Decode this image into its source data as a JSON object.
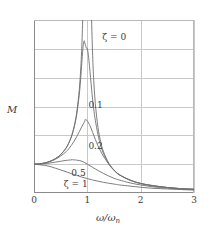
{
  "chart_data": {
    "type": "line",
    "title": "",
    "xlabel": "ω/ωn",
    "xlabel_main": "ω/ω",
    "xlabel_sub": "n",
    "ylabel": "M",
    "xlim": [
      0,
      3
    ],
    "ylim": [
      0,
      6
    ],
    "xticks": [
      "0",
      "1",
      "2",
      "3"
    ],
    "xtick_values": [
      0,
      1,
      2,
      3
    ],
    "yticks": [
      "0",
      "1",
      "2",
      "3",
      "4",
      "5",
      "6"
    ],
    "ytick_values": [
      0,
      1,
      2,
      3,
      4,
      5,
      6
    ],
    "grid": true,
    "legend": "inline-annotations",
    "line_color": "#6f6f6f",
    "grid_color": "#c9c9c9",
    "axis_color": "#8a8a8a",
    "series": [
      {
        "name": "ζ = 0",
        "zeta": 0,
        "label": "ζ = 0",
        "label_x": 1.28,
        "label_y": 5.55,
        "peak_x": 1.0,
        "peak_y": null,
        "x": [
          0,
          0.1,
          0.2,
          0.3,
          0.4,
          0.5,
          0.6,
          0.65,
          0.7,
          0.75,
          0.8,
          0.85,
          0.88,
          0.9,
          0.92,
          0.94,
          0.96,
          0.98,
          1.02,
          1.04,
          1.06,
          1.08,
          1.1,
          1.12,
          1.15,
          1.2,
          1.25,
          1.3,
          1.4,
          1.5,
          1.6,
          1.8,
          2.0,
          2.25,
          2.5,
          2.75,
          3.0
        ],
        "values": [
          1.0,
          1.01,
          1.04,
          1.1,
          1.19,
          1.33,
          1.56,
          1.73,
          1.96,
          2.29,
          2.78,
          3.6,
          4.43,
          5.26,
          6.52,
          8.6,
          12.76,
          25.25,
          24.75,
          12.26,
          8.11,
          6.03,
          4.76,
          3.91,
          3.1,
          2.27,
          1.78,
          1.45,
          1.04,
          0.8,
          0.64,
          0.45,
          0.33,
          0.25,
          0.19,
          0.15,
          0.13
        ]
      },
      {
        "name": "ζ = 0.1",
        "zeta": 0.1,
        "label": "0.1",
        "label_x": 1.02,
        "label_y": 3.18,
        "peak_x": 0.99,
        "peak_y": 5.03,
        "x": [
          0,
          0.1,
          0.2,
          0.3,
          0.4,
          0.5,
          0.6,
          0.65,
          0.7,
          0.75,
          0.8,
          0.85,
          0.88,
          0.9,
          0.92,
          0.94,
          0.96,
          0.98,
          0.99,
          1.0,
          1.02,
          1.04,
          1.06,
          1.08,
          1.1,
          1.12,
          1.15,
          1.2,
          1.25,
          1.3,
          1.4,
          1.5,
          1.6,
          1.8,
          2.0,
          2.25,
          2.5,
          2.75,
          3.0
        ],
        "values": [
          1.0,
          1.01,
          1.04,
          1.1,
          1.19,
          1.33,
          1.55,
          1.72,
          1.94,
          2.25,
          2.71,
          3.43,
          4.08,
          4.61,
          5.07,
          5.28,
          5.16,
          5.03,
          5.03,
          5.0,
          4.78,
          4.41,
          4.0,
          3.6,
          3.23,
          2.91,
          2.52,
          2.02,
          1.65,
          1.38,
          1.01,
          0.79,
          0.63,
          0.45,
          0.33,
          0.25,
          0.19,
          0.15,
          0.13
        ]
      },
      {
        "name": "ζ = 0.2",
        "zeta": 0.2,
        "label": "0.2",
        "label_x": 1.02,
        "label_y": 1.78,
        "peak_x": 0.96,
        "peak_y": 2.55,
        "x": [
          0,
          0.1,
          0.2,
          0.3,
          0.4,
          0.5,
          0.6,
          0.65,
          0.7,
          0.75,
          0.8,
          0.85,
          0.9,
          0.95,
          0.96,
          1.0,
          1.05,
          1.1,
          1.15,
          1.2,
          1.25,
          1.3,
          1.4,
          1.5,
          1.6,
          1.8,
          2.0,
          2.25,
          2.5,
          2.75,
          3.0
        ],
        "values": [
          1.0,
          1.01,
          1.04,
          1.09,
          1.17,
          1.28,
          1.43,
          1.53,
          1.65,
          1.79,
          1.95,
          2.13,
          2.31,
          2.48,
          2.55,
          2.5,
          2.33,
          2.1,
          1.86,
          1.64,
          1.45,
          1.28,
          1.01,
          0.79,
          0.63,
          0.44,
          0.33,
          0.24,
          0.19,
          0.15,
          0.13
        ]
      },
      {
        "name": "ζ = 0.5",
        "zeta": 0.5,
        "label": "0.5",
        "label_x": 0.7,
        "label_y": 0.82,
        "peak_x": 0.707,
        "peak_y": 1.155,
        "x": [
          0,
          0.1,
          0.2,
          0.3,
          0.4,
          0.5,
          0.6,
          0.7,
          0.707,
          0.8,
          0.9,
          1.0,
          1.1,
          1.2,
          1.3,
          1.4,
          1.5,
          1.6,
          1.8,
          2.0,
          2.25,
          2.5,
          2.75,
          3.0
        ],
        "values": [
          1.0,
          1.0,
          1.02,
          1.04,
          1.07,
          1.1,
          1.13,
          1.15,
          1.155,
          1.14,
          1.1,
          1.0,
          0.89,
          0.78,
          0.68,
          0.59,
          0.51,
          0.45,
          0.35,
          0.28,
          0.21,
          0.17,
          0.14,
          0.12
        ]
      },
      {
        "name": "ζ = 1",
        "zeta": 1,
        "label": "ζ = 1",
        "label_x": 0.56,
        "label_y": 0.44,
        "peak_x": 0,
        "peak_y": 1.0,
        "x": [
          0,
          0.1,
          0.2,
          0.3,
          0.4,
          0.5,
          0.6,
          0.7,
          0.8,
          0.9,
          1.0,
          1.1,
          1.2,
          1.3,
          1.4,
          1.5,
          1.6,
          1.8,
          2.0,
          2.25,
          2.5,
          2.75,
          3.0
        ],
        "values": [
          1.0,
          0.98,
          0.96,
          0.92,
          0.86,
          0.8,
          0.74,
          0.67,
          0.61,
          0.55,
          0.5,
          0.45,
          0.41,
          0.37,
          0.34,
          0.31,
          0.28,
          0.24,
          0.2,
          0.16,
          0.14,
          0.12,
          0.1
        ]
      }
    ]
  }
}
